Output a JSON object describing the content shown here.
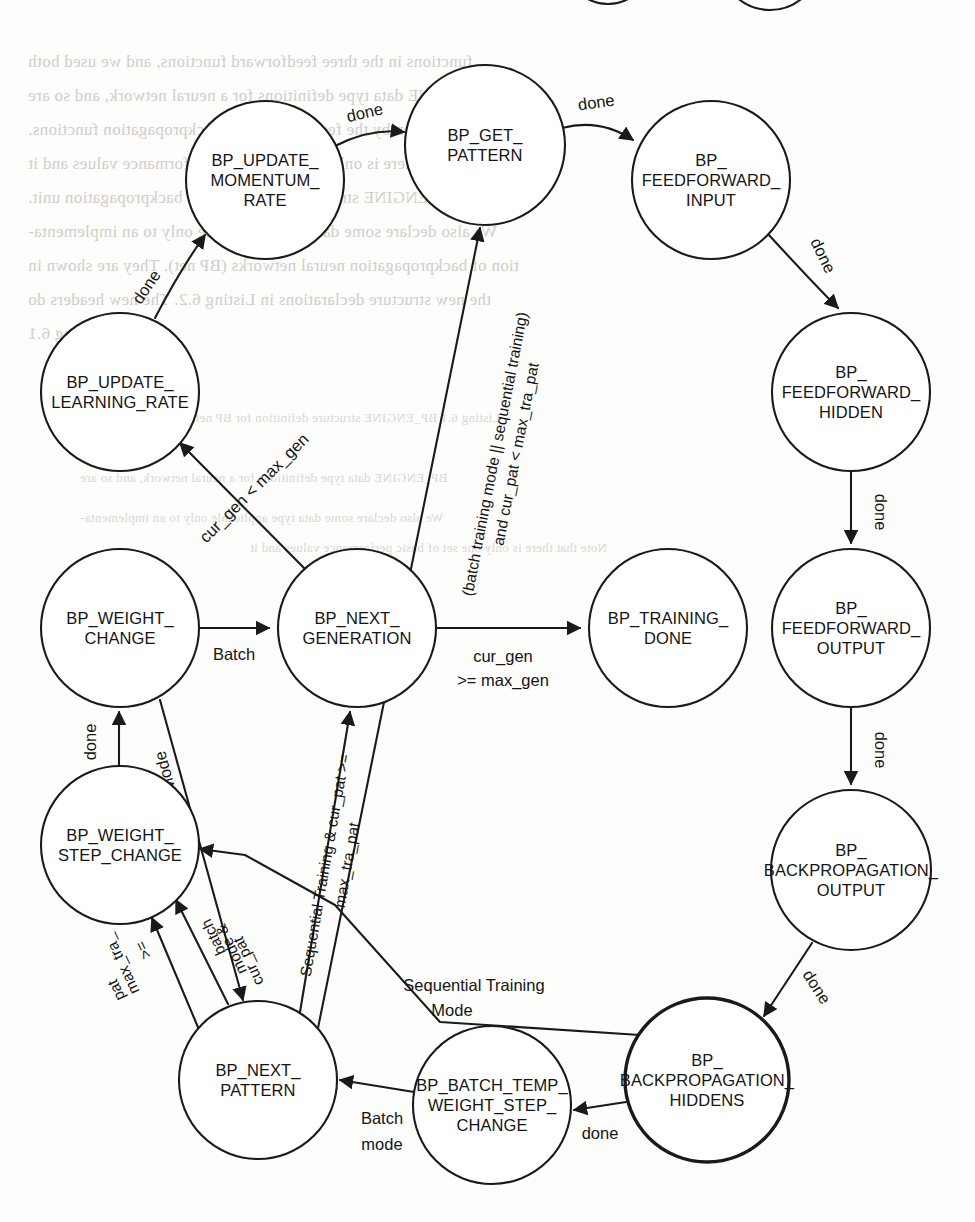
{
  "diagram": {
    "stroke_color": "#1a1a1a",
    "background_color": "#ffffff",
    "nodes": [
      {
        "id": "get_pattern",
        "label_lines": [
          "BP_GET_",
          "PATTERN"
        ],
        "cx": 485,
        "cy": 145,
        "r": 80,
        "thick": false
      },
      {
        "id": "update_momentum",
        "label_lines": [
          "BP_UPDATE_",
          "MOMENTUM_",
          "RATE"
        ],
        "cx": 265,
        "cy": 180,
        "r": 79,
        "thick": false
      },
      {
        "id": "ff_input",
        "label_lines": [
          "BP_",
          "FEEDFORWARD_",
          "INPUT"
        ],
        "cx": 711,
        "cy": 180,
        "r": 79,
        "thick": false
      },
      {
        "id": "update_learning",
        "label_lines": [
          "BP_UPDATE_",
          "LEARNING_RATE"
        ],
        "cx": 120,
        "cy": 392,
        "r": 79,
        "thick": false
      },
      {
        "id": "ff_hidden",
        "label_lines": [
          "BP_",
          "FEEDFORWARD_",
          "HIDDEN"
        ],
        "cx": 851,
        "cy": 392,
        "r": 79,
        "thick": false
      },
      {
        "id": "weight_change",
        "label_lines": [
          "BP_WEIGHT_",
          "CHANGE"
        ],
        "cx": 120,
        "cy": 628,
        "r": 79,
        "thick": false
      },
      {
        "id": "next_generation",
        "label_lines": [
          "BP_NEXT_",
          "GENERATION"
        ],
        "cx": 357,
        "cy": 628,
        "r": 79,
        "thick": false
      },
      {
        "id": "training_done",
        "label_lines": [
          "BP_TRAINING_",
          "DONE"
        ],
        "cx": 668,
        "cy": 628,
        "r": 79,
        "thick": false
      },
      {
        "id": "ff_output",
        "label_lines": [
          "BP_",
          "FEEDFORWARD_",
          "OUTPUT"
        ],
        "cx": 851,
        "cy": 628,
        "r": 79,
        "thick": false
      },
      {
        "id": "weight_step",
        "label_lines": [
          "BP_WEIGHT_",
          "STEP_CHANGE"
        ],
        "cx": 120,
        "cy": 845,
        "r": 79,
        "thick": false
      },
      {
        "id": "bp_output",
        "label_lines": [
          "BP_",
          "BACKPROPAGATION_",
          "OUTPUT"
        ],
        "cx": 851,
        "cy": 870,
        "r": 80,
        "thick": false
      },
      {
        "id": "next_pattern",
        "label_lines": [
          "BP_NEXT_",
          "PATTERN"
        ],
        "cx": 258,
        "cy": 1080,
        "r": 79,
        "thick": false
      },
      {
        "id": "batch_temp",
        "label_lines": [
          "BP_BATCH_TEMP_",
          "WEIGHT_STEP_",
          "CHANGE"
        ],
        "cx": 492,
        "cy": 1105,
        "r": 79,
        "thick": false
      },
      {
        "id": "bp_hiddens",
        "label_lines": [
          "BP_",
          "BACKPROPAGATION_",
          "HIDDENS"
        ],
        "cx": 707,
        "cy": 1080,
        "r": 82,
        "thick": true
      }
    ],
    "edges": [
      {
        "id": "e_momentum_getpattern",
        "from": "update_momentum",
        "to": "get_pattern",
        "label": "done"
      },
      {
        "id": "e_getpattern_ffinput",
        "from": "get_pattern",
        "to": "ff_input",
        "label": "done"
      },
      {
        "id": "e_ffinput_ffhidden",
        "from": "ff_input",
        "to": "ff_hidden",
        "label": "done"
      },
      {
        "id": "e_ffhidden_ffoutput",
        "from": "ff_hidden",
        "to": "ff_output",
        "label": "done"
      },
      {
        "id": "e_ffoutput_bpoutput",
        "from": "ff_output",
        "to": "bp_output",
        "label": "done"
      },
      {
        "id": "e_bpoutput_bphiddens",
        "from": "bp_output",
        "to": "bp_hiddens",
        "label": "done"
      },
      {
        "id": "e_bphiddens_batchtemp",
        "from": "bp_hiddens",
        "to": "batch_temp",
        "label": "done"
      },
      {
        "id": "e_batchtemp_nextpattern",
        "from": "batch_temp",
        "to": "next_pattern",
        "label": "Batch\nmode"
      },
      {
        "id": "e_bphiddens_weightstep",
        "from": "bp_hiddens",
        "to": "weight_step",
        "label": "Sequential Training\nMode"
      },
      {
        "id": "e_weightstep_weightchange",
        "from": "weight_step",
        "to": "weight_change",
        "label": "done"
      },
      {
        "id": "e_weightchange_nextgen",
        "from": "weight_change",
        "to": "next_generation",
        "label": "Batch"
      },
      {
        "id": "e_nextgen_updatelearning",
        "from": "next_generation",
        "to": "update_learning",
        "label": "cur_gen < max_gen"
      },
      {
        "id": "e_updatelearning_momentum",
        "from": "update_learning",
        "to": "update_momentum",
        "label": "done"
      },
      {
        "id": "e_nextgen_trainingdone",
        "from": "next_generation",
        "to": "training_done",
        "label": "cur_gen\n>= max_gen"
      },
      {
        "id": "e_nextpattern_getpattern",
        "from": "next_pattern",
        "to": "get_pattern",
        "label": "(batch training mode || sequential training)\nand cur_pat < max_tra_pat"
      },
      {
        "id": "e_nextpattern_nextgen",
        "from": "next_pattern",
        "to": "next_generation",
        "label": "Sequential Training & cur_pat >=\nmax_tra_pat"
      },
      {
        "id": "e_weightchange_nextpattern",
        "from": "weight_change",
        "to": "next_pattern",
        "label": "Sequential Mode"
      },
      {
        "id": "e_nextpattern_weightstep_a",
        "from": "next_pattern",
        "to": "weight_step",
        "label": "batch\nmode &\ncur_pat"
      },
      {
        "id": "e_nextpattern_weightstep_b",
        "from": "next_pattern",
        "to": "weight_step",
        "label": "max_tra_\n>=\npat"
      }
    ],
    "edge_labels": {
      "done": "done",
      "batch": "Batch",
      "batch_mode_l1": "Batch",
      "batch_mode_l2": "mode",
      "seq_training_mode_l1": "Sequential Training",
      "seq_training_mode_l2": "Mode",
      "sequential_mode": "Sequential Mode",
      "cur_gen_lt": "cur_gen < max_gen",
      "cur_gen_ge_l1": "cur_gen",
      "cur_gen_ge_l2": ">= max_gen",
      "batch_cond_l1": "(batch training mode || sequential training)",
      "batch_cond_l2": "and cur_pat < max_tra_pat",
      "seq_cur_pat_l1": "Sequential Training & cur_pat >=",
      "seq_cur_pat_l2": "max_tra_pat",
      "batch_mode_cur_l1": "batch",
      "batch_mode_cur_l2": "mode &",
      "batch_mode_cur_l3": "cur_pat",
      "max_tra_pat_l1": "max_tra_",
      "max_tra_pat_l2": ">=",
      "max_tra_pat_l3": "pat"
    }
  },
  "page_bleed": {
    "lines": [
      "functions in the three feedforward functions, and we used both",
      "BP_ENGINE data type definitions for a neural network, and so are",
      "the ones given by the feedforward and backpropagation functions.",
      "Note that there is only one set of basic performance values and it",
      "is the BP_ENGINE struct definitions for the backpropagation unit.",
      "We also declare some data type applicable only to an implementa-",
      "tion of backpropagation neural networks (BP net). They are shown in",
      "the new structure declarations in Listing 6.2. The new headers do",
      "in Listing 6.1",
      "Listing 6.1   BP_ENGINE structure definition for BP nets"
    ]
  }
}
